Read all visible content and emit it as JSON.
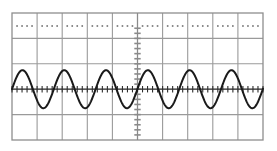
{
  "figure": {
    "kind": "oscilloscope-graticule-waveform",
    "background_color": "#ffffff",
    "width": 277,
    "height": 151
  },
  "graticule": {
    "name": "oscilloscope-graticule",
    "columns": 10,
    "rows": 5,
    "plot_left": 12,
    "plot_top": 13,
    "plot_right": 263,
    "plot_bottom": 140,
    "cell_width": 25.1,
    "cell_height": 25.4,
    "grid_color": "#9a9a9a",
    "grid_line_width": 1.1,
    "border_color": "#8e8e8e",
    "border_line_width": 1.3,
    "vertical_gridlines_x": [
      12,
      37.1,
      62.2,
      87.3,
      112.4,
      137.5,
      162.6,
      187.7,
      212.8,
      237.9,
      263
    ],
    "horizontal_gridlines_y": [
      13,
      38.4,
      63.8,
      89.2,
      114.6,
      140
    ]
  },
  "center_axes": {
    "vertical_axis": {
      "name": "center-vertical-axis",
      "x": 137.5,
      "color": "#8a8a8a",
      "line_width": 1.2,
      "tick_color": "#8a8a8a",
      "tick_half_length": 3.2,
      "tick_spacing": 5.08,
      "tick_count": 25,
      "tick_line_width": 1.6
    },
    "horizontal_axis": {
      "name": "center-horizontal-axis",
      "y": 89.2,
      "color": "#3a3a3a",
      "line_width": 1.2,
      "tick_color": "#2e2e2e",
      "tick_half_length": 3.2,
      "tick_spacing": 5.02,
      "tick_count": 50,
      "tick_line_width": 1.1
    }
  },
  "top_row_dots": {
    "name": "top-row-dot-markers",
    "dots_per_cell": 4,
    "dot_row_y": 26,
    "dot_size": 1.6,
    "dot_gap": 5.0,
    "dot_color": "#6f6f6f",
    "cells": 10
  },
  "chart_data": {
    "type": "line",
    "title": "",
    "subtitle": "",
    "xlabel": "",
    "ylabel": "",
    "grid": true,
    "legend_position": "none",
    "series": [
      {
        "name": "sine-waveform",
        "color": "#1a1a1a",
        "line_width": 2.0,
        "waveform": "sine",
        "amplitude_px": 19.0,
        "period_px": 41.8,
        "cycles_visible": 6.0,
        "baseline_y": 89.2,
        "phase_deg": 0,
        "start_x": 12,
        "end_x": 263,
        "peak_y": 70.2,
        "trough_y": 108.2,
        "peaks_x": [
          22.5,
          64.3,
          106.1,
          147.9,
          189.7,
          231.5
        ],
        "troughs_x": [
          43.4,
          85.2,
          127.0,
          168.8,
          210.6,
          252.4
        ],
        "zero_crossings_x": [
          12.0,
          33.0,
          53.9,
          74.8,
          95.6,
          116.5,
          137.5,
          158.4,
          179.2,
          200.1,
          221.0,
          241.9,
          262.8
        ]
      }
    ],
    "axis_ranges": {
      "x_divisions": 10,
      "y_divisions": 5,
      "amplitude_divisions": 0.75
    }
  }
}
